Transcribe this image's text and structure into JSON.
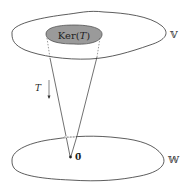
{
  "diagram": {
    "domain_space": {
      "label": "𝕍"
    },
    "codomain_space": {
      "label": "𝕎"
    },
    "kernel": {
      "label_prefix": "Ker(",
      "label_var": "T",
      "label_suffix": ")",
      "fill": "#9a9a9a"
    },
    "map": {
      "label": "T"
    },
    "zero_vector": {
      "label": "0̄"
    },
    "colors": {
      "stroke": "#333333",
      "kernel_fill": "#9a9a9a",
      "background": "#ffffff"
    }
  }
}
